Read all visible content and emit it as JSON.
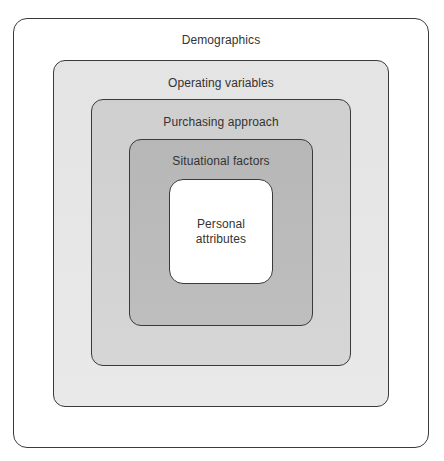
{
  "diagram": {
    "type": "nested-layers",
    "layers": [
      {
        "label": "Demographics",
        "fill": "#ffffff"
      },
      {
        "label": "Operating variables",
        "fill": "#e6e6e6"
      },
      {
        "label": "Purchasing approach",
        "fill": "#d2d2d2"
      },
      {
        "label": "Situational factors",
        "fill": "#bbbbbb"
      },
      {
        "label": "Personal\nattributes",
        "fill": "#ffffff"
      }
    ],
    "border_color": "#3a3a3a"
  }
}
